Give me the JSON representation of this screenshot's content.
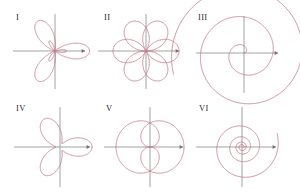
{
  "figure": {
    "width": 300,
    "height": 196,
    "background": "#ffffff",
    "curve_color": "#c4788a",
    "axis_color": "#8a8a8a",
    "label_color": "#2b2b2b",
    "curve_width": 0.85
  },
  "panels": [
    {
      "id": "panel-1",
      "label": "I",
      "label_x": 16,
      "label_y": 13,
      "origin_x": 55,
      "origin_y": 51,
      "axis": {
        "x_min": -42,
        "x_max": 30,
        "y_min": -38,
        "y_max": 37,
        "x_arrow": true,
        "y_arrow": false
      },
      "curve": {
        "type": "polar",
        "formula": "r = 1 + 2*cos(3*theta)",
        "a": 1.0,
        "b": 2.0,
        "k": 3,
        "rotation_deg": 0,
        "scale": 11.5,
        "theta_start": 0,
        "theta_end": 6.283185307179586,
        "samples": 1400
      }
    },
    {
      "id": "panel-2",
      "label": "II",
      "label_x": 104,
      "label_y": 13,
      "origin_x": 146,
      "origin_y": 51,
      "axis": {
        "x_min": -48,
        "x_max": 33,
        "y_min": -38,
        "y_max": 37,
        "x_arrow": true,
        "y_arrow": false
      },
      "curve": {
        "type": "polar",
        "formula": "r = cos(3*theta/2)",
        "a": 0.0,
        "b": 1.0,
        "k": 1.5,
        "rotation_deg": 0,
        "scale": 33,
        "theta_start": 0,
        "theta_end": 12.566370614359172,
        "samples": 1600
      }
    },
    {
      "id": "panel-3",
      "label": "III",
      "label_x": 198,
      "label_y": 13,
      "origin_x": 244,
      "origin_y": 53,
      "axis": {
        "x_min": -48,
        "x_max": 34,
        "y_min": -40,
        "y_max": 37,
        "x_arrow": true,
        "y_arrow": false
      },
      "curve": {
        "type": "spiral-archimedean",
        "formula": "r = 4.6*theta",
        "coefficient": 4.6,
        "rotation_deg": 0,
        "scale": 1,
        "theta_start": 0,
        "theta_end": 16.0,
        "samples": 1400
      }
    },
    {
      "id": "panel-4",
      "label": "IV",
      "label_x": 16,
      "label_y": 104,
      "origin_x": 60,
      "origin_y": 147,
      "axis": {
        "x_min": -46,
        "x_max": 30,
        "y_min": -40,
        "y_max": 40,
        "x_arrow": true,
        "y_arrow": false
      },
      "curve": {
        "type": "polar",
        "formula": "r = 1 + 0.75*cos(3*theta)",
        "a": 1.0,
        "b": 0.78,
        "k": 3,
        "rotation_deg": 0,
        "scale": 18,
        "theta_start": 0,
        "theta_end": 6.283185307179586,
        "samples": 1400
      }
    },
    {
      "id": "panel-5",
      "label": "V",
      "label_x": 106,
      "label_y": 104,
      "origin_x": 150,
      "origin_y": 147,
      "axis": {
        "x_min": -46,
        "x_max": 33,
        "y_min": -40,
        "y_max": 40,
        "x_arrow": true,
        "y_arrow": false
      },
      "curve": {
        "type": "polar",
        "formula": "r = cos(theta/2)",
        "a": 0.0,
        "b": 1.0,
        "k": 0.5,
        "rotation_deg": 0,
        "scale": 34,
        "theta_start": 0,
        "theta_end": 12.566370614359172,
        "samples": 1600
      }
    },
    {
      "id": "panel-6",
      "label": "VI",
      "label_x": 199,
      "label_y": 104,
      "origin_x": 242,
      "origin_y": 147,
      "axis": {
        "x_min": -46,
        "x_max": 34,
        "y_min": -40,
        "y_max": 40,
        "x_arrow": true,
        "y_arrow": false
      },
      "curve": {
        "type": "spiral-logarithmic",
        "formula": "r = 2.0*exp(0.115*theta)",
        "coefficient": 2.0,
        "growth": 0.115,
        "rotation_deg": 0,
        "scale": 1,
        "theta_start": 0,
        "theta_end": 25.5,
        "samples": 1600
      }
    }
  ]
}
